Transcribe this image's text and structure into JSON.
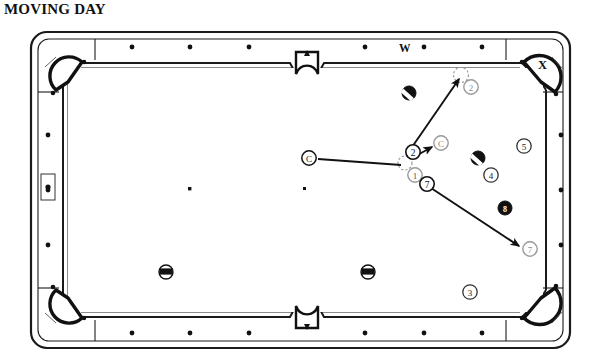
{
  "title": "MOVING DAY",
  "diagram": {
    "type": "billiards-table-diagram",
    "table": {
      "pockets": [
        {
          "name": "top-left-corner",
          "x": 68,
          "y": 55,
          "label": ""
        },
        {
          "name": "top-side",
          "x": 307,
          "y": 47,
          "label": ""
        },
        {
          "name": "top-right-corner",
          "x": 541,
          "y": 62,
          "label": "X"
        },
        {
          "name": "bottom-left-corner",
          "x": 68,
          "y": 318,
          "label": ""
        },
        {
          "name": "bottom-side",
          "x": 307,
          "y": 325,
          "label": ""
        },
        {
          "name": "bottom-right-corner",
          "x": 541,
          "y": 318,
          "label": ""
        }
      ],
      "rail_labels": [
        {
          "name": "rail-label-w",
          "text": "W",
          "x": 404,
          "y": 47
        },
        {
          "name": "pocket-label-x",
          "text": "X",
          "x": 543,
          "y": 64
        }
      ],
      "highlighted_diamond": {
        "name": "left-rail-diamond-highlight",
        "x": 56,
        "y": 185
      }
    },
    "balls": [
      {
        "name": "striped-ball-top",
        "kind": "striped",
        "x": 409,
        "y": 93
      },
      {
        "name": "striped-ball-right",
        "kind": "striped",
        "x": 478,
        "y": 158
      },
      {
        "name": "solid-ball-eight",
        "kind": "solid",
        "x": 505,
        "y": 208
      },
      {
        "name": "striped-ball-bottom-left",
        "kind": "striped",
        "x": 166,
        "y": 272
      },
      {
        "name": "striped-ball-bottom-mid",
        "kind": "striped",
        "x": 368,
        "y": 272
      }
    ],
    "markers": [
      {
        "name": "marker-cue-start",
        "text": "C",
        "x": 309,
        "y": 158,
        "style": "dark"
      },
      {
        "name": "marker-cue-end",
        "text": "C",
        "x": 441,
        "y": 143,
        "style": "light"
      },
      {
        "name": "marker-2-contact",
        "text": "2",
        "x": 413,
        "y": 152,
        "style": "dark"
      },
      {
        "name": "marker-2-target",
        "text": "2",
        "x": 471,
        "y": 87,
        "style": "light"
      },
      {
        "name": "marker-1",
        "text": "1",
        "x": 415,
        "y": 175,
        "style": "light"
      },
      {
        "name": "marker-7-start",
        "text": "7",
        "x": 427,
        "y": 184,
        "style": "dark"
      },
      {
        "name": "marker-7-end",
        "text": "7",
        "x": 530,
        "y": 249,
        "style": "light"
      },
      {
        "name": "marker-4",
        "text": "4",
        "x": 491,
        "y": 175,
        "style": "light"
      },
      {
        "name": "marker-5",
        "text": "5",
        "x": 524,
        "y": 146,
        "style": "light"
      },
      {
        "name": "marker-3",
        "text": "3",
        "x": 470,
        "y": 292,
        "style": "light"
      }
    ],
    "ghost_balls": [
      {
        "name": "ghost-ball-contact",
        "x": 405,
        "y": 163
      },
      {
        "name": "ghost-ball-target",
        "x": 461,
        "y": 75
      }
    ],
    "arrows": [
      {
        "name": "arrow-cue-path",
        "from_x": 318,
        "from_y": 159,
        "to_x": 403,
        "to_y": 165,
        "head": false
      },
      {
        "name": "arrow-object-to-pocket",
        "from_x": 409,
        "from_y": 150,
        "to_x": 460,
        "to_y": 78,
        "head": true
      },
      {
        "name": "arrow-cue-deflect",
        "from_x": 411,
        "from_y": 158,
        "to_x": 434,
        "to_y": 147,
        "head": true
      },
      {
        "name": "arrow-seven-path",
        "from_x": 430,
        "from_y": 188,
        "to_x": 521,
        "to_y": 246,
        "head": true
      }
    ]
  }
}
